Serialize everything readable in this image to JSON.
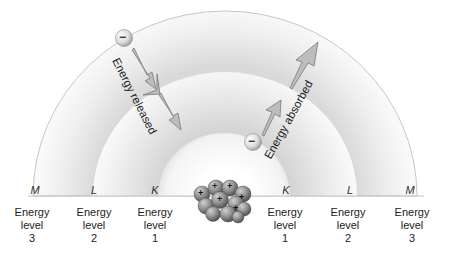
{
  "diagram": {
    "shells": [
      {
        "letter": "M",
        "level_word": "Energy",
        "level_sub": "level",
        "level_num": "3"
      },
      {
        "letter": "L",
        "level_word": "Energy",
        "level_sub": "level",
        "level_num": "2"
      },
      {
        "letter": "K",
        "level_word": "Energy",
        "level_sub": "level",
        "level_num": "1"
      }
    ],
    "left_labels": [
      {
        "letter": "M",
        "word": "Energy",
        "sub": "level",
        "num": "3"
      },
      {
        "letter": "L",
        "word": "Energy",
        "sub": "level",
        "num": "2"
      },
      {
        "letter": "K",
        "word": "Energy",
        "sub": "level",
        "num": "1"
      }
    ],
    "right_labels": [
      {
        "letter": "K",
        "word": "Energy",
        "sub": "level",
        "num": "1"
      },
      {
        "letter": "L",
        "word": "Energy",
        "sub": "level",
        "num": "2"
      },
      {
        "letter": "M",
        "word": "Energy",
        "sub": "level",
        "num": "3"
      }
    ],
    "arrows": {
      "released": "Energy released",
      "absorbed": "Energy absorbed"
    },
    "electron_symbol": "−",
    "nucleus_symbol": "+",
    "colors": {
      "shell_light": "#f7f7f7",
      "shell_shade": "#d6d6d6",
      "outline": "#b5b5b5",
      "arrow_fill": "#b9b9b9",
      "arrow_stroke": "#7a7a7a",
      "nucleus": "#8a8a8a"
    }
  }
}
